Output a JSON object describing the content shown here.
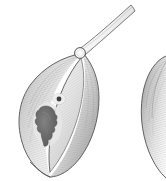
{
  "figure": {
    "title": "Lanceolate specimen illustration",
    "domain": "scientific-line-drawing",
    "canvas": {
      "width": 166,
      "height": 181,
      "background": "#ffffff"
    },
    "description": "Two stippled and hatched lanceolate (leaf- or valve-shaped) specimens rendered in grayscale; the left specimen is complete and shows an apical stalk terminating at a small ring, an inner lens-shaped lobe, a small round pore and a large irregular dark inclusion. The right specimen is cropped by the image edge."
  },
  "palette": {
    "background": "#ffffff",
    "outline": "#4a4a4a",
    "outline_soft": "#6e6e6e",
    "body_light": "#f2f2f2",
    "body_mid": "#d6d6d6",
    "body_dark": "#a8a8a8",
    "body_shadow": "#8d8d8d",
    "hatch": "#9a9a9a",
    "inclusion_dark": "#5d5d5d",
    "inclusion_mid": "#7a7a7a",
    "pore_dark": "#3c3c3c",
    "halo": "#e8e8e8",
    "stalk_fill": "#f6f6f6"
  },
  "specimens": [
    {
      "id": "specimen-left",
      "label": "Left specimen (complete)",
      "position": "left",
      "complete": true,
      "outline_points": "84,52 62,58 42,70 27,88 20,108 21,130 30,150 44,166 56,172 70,160 83,138 92,114 94,88 90,66",
      "parts": [
        {
          "name": "apical-stalk",
          "label": "Apical stalk",
          "tip_x": 131,
          "tip_y": 6,
          "base_x": 83,
          "base_y": 52
        },
        {
          "name": "apical-ring",
          "label": "Apical ring",
          "cx": 80,
          "cy": 53,
          "r": 5.4
        },
        {
          "name": "outer-lobe-left",
          "label": "Left outer lobe"
        },
        {
          "name": "outer-lobe-right",
          "label": "Right outer lobe"
        },
        {
          "name": "inner-lens",
          "label": "Inner lens-shaped lobe"
        },
        {
          "name": "pore",
          "label": "Pore",
          "cx": 59,
          "cy": 99,
          "r": 2.4,
          "halo_r": 6.2
        },
        {
          "name": "inclusion",
          "label": "Irregular dark inclusion",
          "cx": 47,
          "cy": 125,
          "width": 24,
          "height": 38
        },
        {
          "name": "basal-apex",
          "label": "Basal apex",
          "x": 27,
          "y": 172
        }
      ]
    },
    {
      "id": "specimen-right",
      "label": "Right specimen (cropped at image edge)",
      "position": "right",
      "complete": false,
      "outline_points": "166,58 154,64 146,78 143,98 146,122 154,146 166,164",
      "parts": [
        {
          "name": "outer-lobe",
          "label": "Outer lobe"
        },
        {
          "name": "basal-taper",
          "label": "Basal taper"
        }
      ]
    }
  ],
  "annotations": {
    "shading_style": "fine parallel hatching following the body curvature",
    "line_weight": "hairline",
    "scale_bar": null,
    "labels_visible": []
  }
}
